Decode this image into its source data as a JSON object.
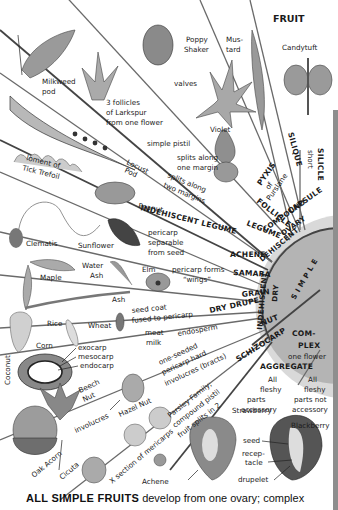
{
  "title": "FRUIT",
  "hub": {
    "simple": "S I M P L E",
    "dehiscent": "DEHISCENT",
    "indehiscent": "INDEHISCENT",
    "dry": "DRY",
    "compound_ovary": [
      "COMPOUND",
      "OVARY"
    ],
    "complex": [
      "COM-",
      "PLEX"
    ]
  },
  "categories": {
    "silicle": "SILICLE",
    "silicle_note": "short",
    "silique": "SILIQUE",
    "pyxis": [
      "PYXIS",
      "of",
      "Purslane"
    ],
    "capsule": "CAPSULE",
    "follicle": "FOLLICLE",
    "legume": "LEGUME",
    "indehiscent_legume": "INDEHISCENT LEGUME",
    "achene": "ACHENE",
    "samara": "SAMARA",
    "grain": "GRAIN",
    "dry_drupe": "DRY DRUPE",
    "nut": "NUT",
    "schizocarp": "SCHIZOCARP",
    "aggregate": "AGGREGATE",
    "aggregate_note": "one flower"
  },
  "labels": {
    "milkweed": [
      "Milkweed",
      "pod"
    ],
    "larkspur": [
      "3 follicles",
      "of Larkspur",
      "from one flower"
    ],
    "poppy": [
      "Poppy",
      "Shaker"
    ],
    "mustard": [
      "Mus-",
      "tard"
    ],
    "candytuft": "Candytuft",
    "valves": "valves",
    "violet": "Violet",
    "simple_pistil": "simple pistil",
    "one_margin": [
      "splits along",
      "one margin"
    ],
    "locust": [
      "Locust",
      "Pod"
    ],
    "tick_trefoil": [
      "loment of",
      "Tick Trefoil"
    ],
    "two_margins": [
      "splits along",
      "two margins"
    ],
    "peanut": "Peanut",
    "clematis": "Clematis",
    "sunflower": "Sunflower",
    "pericarp_sep": [
      "pericarp",
      "separable",
      "from seed"
    ],
    "maple": "Maple",
    "water_ash": [
      "Water",
      "Ash"
    ],
    "ash": "Ash",
    "elm": "Elm",
    "wings": [
      "pericarp forms",
      "“wings”"
    ],
    "rice": "Rice",
    "wheat": "Wheat",
    "seed_coat": [
      "seed coat",
      "fused to pericarp"
    ],
    "corn": "Corn",
    "meat_milk": [
      "meat",
      "milk"
    ],
    "pericarp": "pericarp",
    "endosperm": "endosperm",
    "coconut": "Coconut",
    "exocarp": "exocarp",
    "mesocarp": "mesocarp",
    "endocarp": "endocarp",
    "beech": [
      "Beech",
      "Nut"
    ],
    "hazel": "Hazel Nut",
    "involucres": "involucres",
    "nut_desc": [
      "one-seeded",
      "pericarp hard",
      "involucres (bracts)"
    ],
    "oak": "Oak Acorn",
    "cicuta": "Cicuta",
    "x_section": "X section of mericarps",
    "parsley": [
      "Parsley Family;",
      "compound pistil",
      "fruit splits in 2"
    ],
    "achene2": "Achene",
    "strawberry": "Strawberry",
    "all_accessory": [
      "All",
      "fleshy",
      "parts",
      "accessory"
    ],
    "all_not_accessory": [
      "All",
      "fleshy",
      "parts not",
      "accessory"
    ],
    "blackberry": "Blackberry",
    "seed": "seed",
    "receptacle": [
      "recep-",
      "tacle"
    ],
    "drupelet": "drupelet"
  },
  "footer": {
    "bold": "ALL SIMPLE FRUITS",
    "rest": " develop from one ovary; complex"
  },
  "colors": {
    "hub": "#b4b4b4",
    "ray": "#6a6a6a",
    "ink": "#1a1a1a",
    "paper": "#ffffff"
  }
}
